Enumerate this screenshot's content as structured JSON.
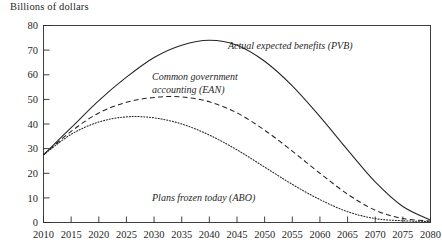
{
  "chart_data": {
    "type": "line",
    "title": "Billions of dollars",
    "xlabel": "",
    "ylabel": "Billions of dollars",
    "xlim": [
      2010,
      2080
    ],
    "ylim": [
      0,
      80
    ],
    "grid": false,
    "legend_position": "inline-annotations",
    "x_ticks": [
      2010,
      2015,
      2020,
      2025,
      2030,
      2035,
      2040,
      2045,
      2050,
      2055,
      2060,
      2065,
      2070,
      2075,
      2080
    ],
    "y_ticks": [
      0,
      10,
      20,
      30,
      40,
      50,
      60,
      70,
      80
    ],
    "x": [
      2010,
      2015,
      2020,
      2025,
      2030,
      2035,
      2040,
      2045,
      2050,
      2055,
      2060,
      2065,
      2070,
      2075,
      2080
    ],
    "series": [
      {
        "name": "Actual expected benefits (PVB)",
        "style": "solid",
        "values": [
          27.5,
          38.5,
          49.5,
          59.0,
          67.0,
          72.0,
          74.0,
          72.0,
          65.5,
          55.5,
          43.0,
          29.5,
          16.5,
          6.5,
          1.0
        ]
      },
      {
        "name": "Common government accounting (EAN)",
        "style": "dashed",
        "values": [
          27.5,
          37.0,
          44.5,
          48.8,
          50.8,
          51.0,
          49.0,
          44.5,
          37.5,
          29.0,
          20.0,
          11.5,
          5.0,
          1.6,
          0.6
        ]
      },
      {
        "name": "Plans frozen today (ABO)",
        "style": "dotted",
        "values": [
          27.5,
          35.8,
          40.8,
          42.9,
          42.5,
          40.0,
          35.5,
          29.5,
          22.5,
          15.5,
          9.3,
          4.4,
          1.6,
          0.7,
          0.4
        ]
      }
    ],
    "annotations": [
      {
        "name": "pvb-label",
        "text": "Actual expected benefits (PVB)",
        "lines": [
          "Actual expected benefits (PVB)"
        ]
      },
      {
        "name": "ean-label",
        "text": "Common government accounting (EAN)",
        "lines": [
          "Common government",
          "accounting (EAN)"
        ]
      },
      {
        "name": "abo-label",
        "text": "Plans frozen today (ABO)",
        "lines": [
          "Plans frozen today (ABO)"
        ]
      }
    ],
    "colors": {
      "line": "#232323",
      "axis": "#2b2b2b",
      "text": "#1f1f1f",
      "background": "#ffffff"
    }
  },
  "axis_title": "Billions of dollars",
  "y_tick_labels": {
    "t0": "0",
    "t1": "10",
    "t2": "20",
    "t3": "30",
    "t4": "40",
    "t5": "50",
    "t6": "60",
    "t7": "70",
    "t8": "80"
  },
  "x_tick_labels": {
    "t0": "2010",
    "t1": "2015",
    "t2": "2020",
    "t3": "2025",
    "t4": "2030",
    "t5": "2035",
    "t6": "2040",
    "t7": "2045",
    "t8": "2050",
    "t9": "2055",
    "t10": "2060",
    "t11": "2065",
    "t12": "2070",
    "t13": "2075",
    "t14": "2080"
  },
  "annotation_text": {
    "pvb": "Actual expected benefits (PVB)",
    "ean_line1": "Common government",
    "ean_line2": "accounting (EAN)",
    "abo": "Plans frozen today (ABO)"
  }
}
